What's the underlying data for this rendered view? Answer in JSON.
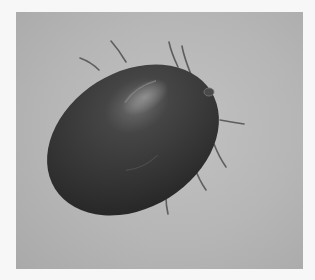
{
  "image": {
    "subject": "engorged tick",
    "description": "Grayscale photograph of an engorged tick with a dark glossy oval body and thin legs on a light gray background",
    "colors": {
      "page_background": "#f7f7f7",
      "photo_background": "#b8b8b8",
      "body": "#333333",
      "body_highlight": "#6a6a6a",
      "legs": "#5a5a5a"
    }
  }
}
